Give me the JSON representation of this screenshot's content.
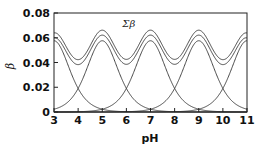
{
  "chart_data": {
    "type": "line",
    "title": "",
    "xlabel": "pH",
    "ylabel": "β",
    "xlim": [
      3,
      11
    ],
    "ylim": [
      0,
      0.08
    ],
    "xticks": [
      3,
      4,
      5,
      6,
      7,
      8,
      9,
      10,
      11
    ],
    "yticks": [
      0,
      0.02,
      0.04,
      0.06,
      0.08
    ],
    "ytick_labels": [
      "0",
      "0.02",
      "0.04",
      "0.06",
      "0.08"
    ],
    "xtick_labels": [
      "3",
      "4",
      "5",
      "6",
      "7",
      "8",
      "9",
      "10",
      "11"
    ],
    "grid": false,
    "legend": null,
    "annotations": [
      {
        "text": "Σβ",
        "x": 7.7,
        "y": 0.067
      }
    ],
    "series": [
      {
        "name": "buffer pKa 3",
        "pKa": 3,
        "concentration": 0.1,
        "peak": 0.058
      },
      {
        "name": "buffer pKa 5",
        "pKa": 5,
        "concentration": 0.1,
        "peak": 0.058
      },
      {
        "name": "buffer pKa 7",
        "pKa": 7,
        "concentration": 0.1,
        "peak": 0.058
      },
      {
        "name": "buffer pKa 9",
        "pKa": 9,
        "concentration": 0.1,
        "peak": 0.058
      },
      {
        "name": "buffer pKa 11",
        "pKa": 11,
        "concentration": 0.1,
        "peak": 0.058
      },
      {
        "name": "Σβ",
        "sum": true,
        "peaks": [
          [
            5,
            0.062
          ],
          [
            7,
            0.062
          ],
          [
            9,
            0.062
          ]
        ],
        "troughs": [
          [
            4,
            0.04
          ],
          [
            6,
            0.04
          ],
          [
            8,
            0.04
          ],
          [
            10,
            0.04
          ]
        ]
      }
    ]
  }
}
